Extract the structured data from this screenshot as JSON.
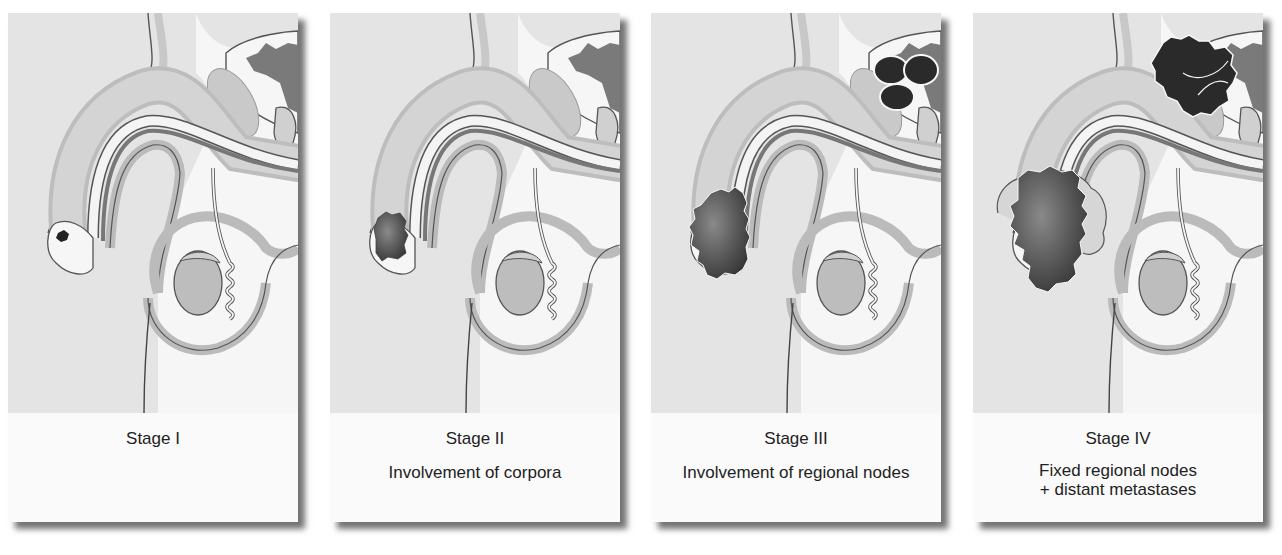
{
  "figure": {
    "type": "staging-diagram",
    "colors": {
      "background": "#ffffff",
      "panel_fill": "#e4e4e4",
      "caption_fill": "#fafafa",
      "organ_light": "#d2d2d2",
      "organ_mid": "#b8b8b8",
      "outline": "#555555",
      "tumor_dark": "#3a3a3a",
      "node_dark": "#2a2a2a"
    },
    "panels": [
      {
        "stage": "Stage I",
        "description": ""
      },
      {
        "stage": "Stage II",
        "description": "Involvement of corpora"
      },
      {
        "stage": "Stage III",
        "description": "Involvement of regional nodes"
      },
      {
        "stage": "Stage IV",
        "description": "Fixed regional nodes\n+ distant metastases"
      }
    ]
  }
}
